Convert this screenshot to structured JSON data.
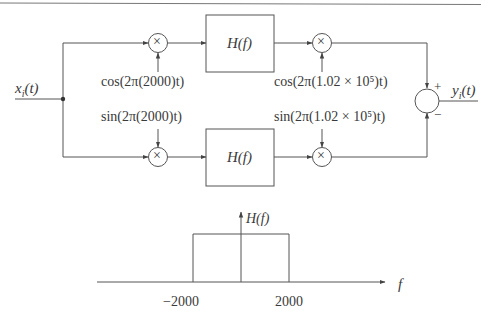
{
  "diagram": {
    "type": "block-diagram",
    "input": {
      "label": "x_i(t)",
      "base": "x",
      "sub": "i",
      "arg": "(t)"
    },
    "output": {
      "label": "y_i(t)",
      "base": "y",
      "sub": "i",
      "arg": "(t)"
    },
    "upper_branch": {
      "mixer1_symbol": "×",
      "mixer1_oscillator": "cos(2π(2000)t)",
      "filter_label": "H(f)",
      "mixer2_symbol": "×",
      "mixer2_oscillator": "cos(2π(1.02 × 10⁵)t)"
    },
    "lower_branch": {
      "mixer1_symbol": "×",
      "mixer1_oscillator": "sin(2π(2000)t)",
      "filter_label": "H(f)",
      "mixer2_symbol": "×",
      "mixer2_oscillator": "sin(2π(1.02 × 10⁵)t)"
    },
    "summer": {
      "plus": "+",
      "minus": "−"
    }
  },
  "filter_response": {
    "ylabel": "H(f)",
    "xlabel": "f",
    "ticks": [
      "−2000",
      "2000"
    ],
    "shape": "rectangular",
    "passband": [
      -2000,
      2000
    ]
  }
}
